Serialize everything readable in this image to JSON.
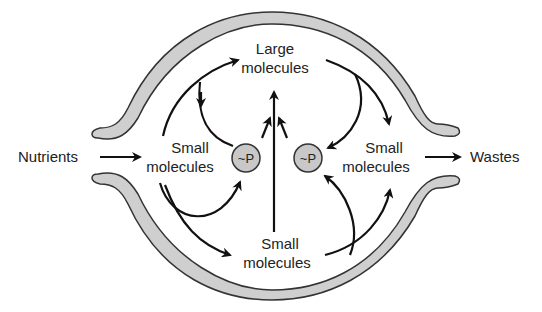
{
  "diagram": {
    "type": "cell metabolism schematic",
    "colors": {
      "membrane_fill": "#cfcfcf",
      "membrane_stroke": "#333333",
      "arrow": "#111111",
      "phosphate_fill": "#c8c8c8",
      "text": "#222222",
      "background": "#ffffff"
    },
    "labels": {
      "nutrients": "Nutrients",
      "wastes": "Wastes",
      "large_molecules_line1": "Large",
      "large_molecules_line2": "molecules",
      "small_left_line1": "Small",
      "small_left_line2": "molecules",
      "small_right_line1": "Small",
      "small_right_line2": "molecules",
      "small_bottom_line1": "Small",
      "small_bottom_line2": "molecules",
      "phosphate_left": "~P",
      "phosphate_right": "~P"
    },
    "nodes": [
      {
        "id": "nutrients",
        "label": "Nutrients"
      },
      {
        "id": "small_left",
        "label": "Small molecules"
      },
      {
        "id": "large",
        "label": "Large molecules"
      },
      {
        "id": "small_right",
        "label": "Small molecules"
      },
      {
        "id": "small_bottom",
        "label": "Small molecules"
      },
      {
        "id": "p_left",
        "label": "~P"
      },
      {
        "id": "p_right",
        "label": "~P"
      },
      {
        "id": "wastes",
        "label": "Wastes"
      }
    ],
    "edges": [
      {
        "from": "nutrients",
        "to": "small_left"
      },
      {
        "from": "small_left",
        "to": "large"
      },
      {
        "from": "p_left",
        "to": "small_left"
      },
      {
        "from": "small_left",
        "to": "p_left"
      },
      {
        "from": "small_left",
        "to": "small_bottom"
      },
      {
        "from": "small_bottom",
        "to": "large"
      },
      {
        "from": "p_left",
        "to": "large"
      },
      {
        "from": "p_right",
        "to": "large"
      },
      {
        "from": "large",
        "to": "small_right"
      },
      {
        "from": "large",
        "to": "p_right"
      },
      {
        "from": "small_bottom",
        "to": "p_right"
      },
      {
        "from": "small_bottom",
        "to": "small_right"
      },
      {
        "from": "small_right",
        "to": "wastes"
      }
    ]
  }
}
